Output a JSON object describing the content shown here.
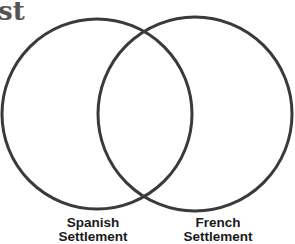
{
  "heading": {
    "visible_fragment": "st"
  },
  "venn": {
    "stroke_color": "#3a3a3c",
    "circles": [
      {
        "name": "Spanish Settlement",
        "cx": 97,
        "cy": 114,
        "r": 95
      },
      {
        "name": "French Settlement",
        "cx": 195,
        "cy": 114,
        "r": 97
      }
    ]
  },
  "labels": {
    "left": {
      "line1": "Spanish",
      "line2": "Settlement"
    },
    "right": {
      "line1": "French",
      "line2": "Settlement"
    }
  }
}
